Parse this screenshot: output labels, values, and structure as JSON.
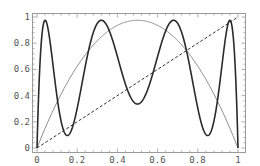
{
  "chart_data": {
    "type": "line",
    "title": "",
    "xlabel": "",
    "ylabel": "",
    "xlim": [
      0,
      1
    ],
    "ylim": [
      0,
      1
    ],
    "grid": false,
    "legend": null,
    "x_ticks": [
      "0",
      "0.2",
      "0.4",
      "0.6",
      "0.8",
      "1"
    ],
    "y_ticks": [
      "0",
      "0.2",
      "0.4",
      "0.6",
      "0.8",
      "1"
    ],
    "series": [
      {
        "name": "logistic map f(x) = r x (1 - x)",
        "style": "solid-gray",
        "color": "#8c8c8c",
        "r": 3.9,
        "x": [
          0,
          0.1,
          0.2,
          0.3,
          0.4,
          0.5,
          0.6,
          0.7,
          0.8,
          0.9,
          1
        ],
        "values": [
          0,
          0.351,
          0.624,
          0.819,
          0.936,
          0.975,
          0.936,
          0.819,
          0.624,
          0.351,
          0
        ]
      },
      {
        "name": "third iterate f^3(x)",
        "style": "solid-black",
        "color": "#2a2a2a",
        "r": 3.9,
        "x": [
          0,
          0.04,
          0.15,
          0.33,
          0.5,
          0.67,
          0.85,
          0.96,
          1
        ],
        "values": [
          0,
          0.975,
          0.095,
          0.975,
          0.336,
          0.975,
          0.095,
          0.975,
          0
        ]
      },
      {
        "name": "identity y = x",
        "style": "dashed-black",
        "color": "#333333",
        "x": [
          0,
          1
        ],
        "values": [
          0,
          1
        ]
      }
    ]
  },
  "axes": {
    "x_tick_labels": [
      "0",
      "0.2",
      "0.4",
      "0.6",
      "0.8",
      "1"
    ],
    "y_tick_labels": [
      "0",
      "0.2",
      "0.4",
      "0.6",
      "0.8",
      "1"
    ]
  }
}
